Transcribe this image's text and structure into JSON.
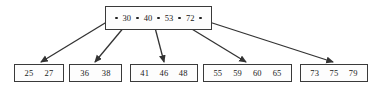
{
  "diagram": {
    "type": "b-tree",
    "title": "",
    "root": {
      "name": "root-node",
      "keys": [
        "30",
        "40",
        "53",
        "72"
      ],
      "pointer_count": 5,
      "box": {
        "x": 105,
        "y": 6,
        "w": 107,
        "h": 24
      }
    },
    "leaves": [
      {
        "name": "leaf-node-1",
        "keys": [
          "25",
          "27"
        ],
        "box": {
          "x": 14,
          "y": 64,
          "w": 50,
          "h": 18
        }
      },
      {
        "name": "leaf-node-2",
        "keys": [
          "36",
          "38"
        ],
        "box": {
          "x": 69,
          "y": 64,
          "w": 53,
          "h": 18
        }
      },
      {
        "name": "leaf-node-3",
        "keys": [
          "41",
          "46",
          "48"
        ],
        "box": {
          "x": 130,
          "y": 64,
          "w": 68,
          "h": 18
        }
      },
      {
        "name": "leaf-node-4",
        "keys": [
          "55",
          "59",
          "60",
          "65"
        ],
        "box": {
          "x": 203,
          "y": 64,
          "w": 89,
          "h": 18
        }
      },
      {
        "name": "leaf-node-5",
        "keys": [
          "73",
          "75",
          "79"
        ],
        "box": {
          "x": 300,
          "y": 64,
          "w": 68,
          "h": 18
        }
      }
    ],
    "edges": [
      {
        "name": "edge-root-to-leaf-1",
        "from": [
          110,
          20
        ],
        "to": [
          41,
          62
        ]
      },
      {
        "name": "edge-root-to-leaf-2",
        "from": [
          130,
          20
        ],
        "to": [
          95,
          62
        ]
      },
      {
        "name": "edge-root-to-leaf-3",
        "from": [
          153,
          20
        ],
        "to": [
          164,
          62
        ]
      },
      {
        "name": "edge-root-to-leaf-4",
        "from": [
          177,
          20
        ],
        "to": [
          246,
          62
        ]
      },
      {
        "name": "edge-root-to-leaf-5",
        "from": [
          203,
          20
        ],
        "to": [
          333,
          62
        ]
      }
    ],
    "colors": {
      "border": "#3a3a3a",
      "text": "#1a1a1a",
      "edge": "#333333",
      "background": "#ffffff",
      "pointer": "#222222"
    }
  }
}
